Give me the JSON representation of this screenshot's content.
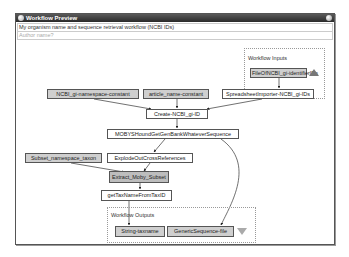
{
  "window": {
    "title": "Workflow Preview"
  },
  "fields": {
    "workflow_title": "My organism name and sequence retrieval workflow (NCBI IDs)",
    "author_placeholder": "Author name?"
  },
  "groups": {
    "inputs_label": "Workflow Inputs",
    "outputs_label": "Workflow Outputs"
  },
  "nodes": {
    "file_input": "FileOfNCBI_gi-identifierIDs",
    "namespace_constant": "NCBI_gi-namespace-constant",
    "article_name_constant": "article_name-constant",
    "spreadsheet_importer": "SpreadsheetImporter-NCBI_gi-IDs",
    "create_id": "Create-NCBI_gi-ID",
    "moby_shound": "MOBYSHoundGetGenBankWhateverSequence",
    "subset_namespace": "Subset_namespace_taxon",
    "explode": "ExplodeOutCrossReferences",
    "extract": "Extract_Moby_Subset",
    "get_tax_name": "getTaxNameFromTaxID",
    "string_taxname": "String-taxname",
    "generic_sequence": "GenericSequence-file"
  },
  "colors": {
    "titlebar": "#2a2a2a",
    "io_node": "#cfcfcf",
    "proc_node": "#ffffff",
    "edge": "#333333"
  }
}
